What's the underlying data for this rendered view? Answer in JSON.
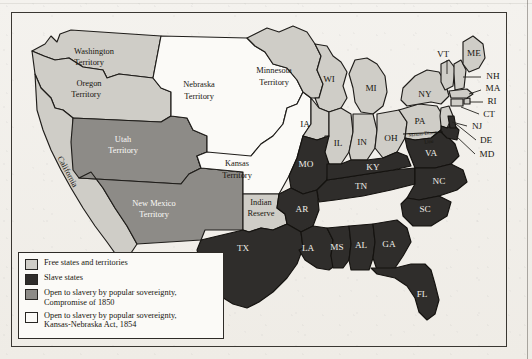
{
  "map": {
    "title_visible": false,
    "frame": true,
    "colors": {
      "free": "#cfcdc7",
      "slave": "#2f2d2b",
      "popular_sovereignty_1850": "#8d8b87",
      "popular_sovereignty_1854": "#fbfaf7",
      "ocean": "#f4f2ee",
      "outline": "#1f1d1a",
      "paper": "#f2f0eb"
    },
    "regions": [
      {
        "id": "washington-territory",
        "label": "Washington\nTerritory",
        "category": "free"
      },
      {
        "id": "oregon-territory",
        "label": "Oregon\nTerritory",
        "category": "free"
      },
      {
        "id": "utah-territory",
        "label": "Utah\nTerritory",
        "category": "popular_sovereignty_1850"
      },
      {
        "id": "california",
        "label": "California",
        "category": "free"
      },
      {
        "id": "new-mexico-territory",
        "label": "New Mexico\nTerritory",
        "category": "popular_sovereignty_1850"
      },
      {
        "id": "nebraska-territory",
        "label": "Nebraska\nTerritory",
        "category": "popular_sovereignty_1854"
      },
      {
        "id": "kansas-territory",
        "label": "Kansas\nTerritory",
        "category": "popular_sovereignty_1854"
      },
      {
        "id": "indian-reserve",
        "label": "Indian\nReserve",
        "category": "free"
      },
      {
        "id": "minnesota-territory",
        "label": "Minnesota\nTerritory",
        "category": "free"
      },
      {
        "id": "wisconsin",
        "label": "WI",
        "category": "free"
      },
      {
        "id": "iowa",
        "label": "IA",
        "category": "free"
      },
      {
        "id": "michigan",
        "label": "MI",
        "category": "free"
      },
      {
        "id": "illinois",
        "label": "IL",
        "category": "free"
      },
      {
        "id": "indiana",
        "label": "IN",
        "category": "free"
      },
      {
        "id": "ohio",
        "label": "OH",
        "category": "free"
      },
      {
        "id": "pennsylvania",
        "label": "PA",
        "category": "free"
      },
      {
        "id": "new-york",
        "label": "NY",
        "category": "free"
      },
      {
        "id": "vermont",
        "label": "VT",
        "category": "free"
      },
      {
        "id": "maine",
        "label": "ME",
        "category": "free"
      },
      {
        "id": "new-hampshire",
        "label": "NH",
        "category": "free"
      },
      {
        "id": "massachusetts",
        "label": "MA",
        "category": "free"
      },
      {
        "id": "rhode-island",
        "label": "RI",
        "category": "free"
      },
      {
        "id": "connecticut",
        "label": "CT",
        "category": "free"
      },
      {
        "id": "new-jersey",
        "label": "NJ",
        "category": "free"
      },
      {
        "id": "delaware",
        "label": "DE",
        "category": "slave"
      },
      {
        "id": "maryland",
        "label": "MD",
        "category": "slave"
      },
      {
        "id": "virginia",
        "label": "VA",
        "category": "slave"
      },
      {
        "id": "north-carolina",
        "label": "NC",
        "category": "slave"
      },
      {
        "id": "south-carolina",
        "label": "SC",
        "category": "slave"
      },
      {
        "id": "georgia",
        "label": "GA",
        "category": "slave"
      },
      {
        "id": "florida",
        "label": "FL",
        "category": "slave"
      },
      {
        "id": "alabama",
        "label": "AL",
        "category": "slave"
      },
      {
        "id": "mississippi",
        "label": "MS",
        "category": "slave"
      },
      {
        "id": "tennessee",
        "label": "TN",
        "category": "slave"
      },
      {
        "id": "kentucky",
        "label": "KY",
        "category": "slave"
      },
      {
        "id": "missouri",
        "label": "MO",
        "category": "slave"
      },
      {
        "id": "arkansas",
        "label": "AR",
        "category": "slave"
      },
      {
        "id": "louisiana",
        "label": "LA",
        "category": "slave"
      },
      {
        "id": "texas",
        "label": "TX",
        "category": "slave"
      }
    ],
    "labels": {
      "washington_territory_l1": "Washington",
      "washington_territory_l2": "Territory",
      "oregon_territory_l1": "Oregon",
      "oregon_territory_l2": "Territory",
      "utah_territory_l1": "Utah",
      "utah_territory_l2": "Territory",
      "california": "California",
      "new_mexico_territory_l1": "New Mexico",
      "new_mexico_territory_l2": "Territory",
      "nebraska_territory_l1": "Nebraska",
      "nebraska_territory_l2": "Territory",
      "kansas_territory_l1": "Kansas",
      "kansas_territory_l2": "Territory",
      "indian_reserve_l1": "Indian",
      "indian_reserve_l2": "Reserve",
      "minnesota_territory_l1": "Minnesota",
      "minnesota_territory_l2": "Territory",
      "mason_dixon_l1": "Mason-Dixon",
      "mason_dixon_l2": "Line",
      "wi": "WI",
      "ia": "IA",
      "mi": "MI",
      "il": "IL",
      "in": "IN",
      "oh": "OH",
      "pa": "PA",
      "ny": "NY",
      "vt": "VT",
      "me": "ME",
      "nh": "NH",
      "ma": "MA",
      "ri": "RI",
      "ct": "CT",
      "nj": "NJ",
      "de": "DE",
      "md": "MD",
      "va": "VA",
      "nc": "NC",
      "sc": "SC",
      "ga": "GA",
      "fl": "FL",
      "al": "AL",
      "ms": "MS",
      "tn": "TN",
      "ky": "KY",
      "mo": "MO",
      "ar": "AR",
      "la": "LA",
      "tx": "TX"
    },
    "legend": {
      "items": [
        {
          "swatch": "#cfcdc7",
          "text": "Free states and territories"
        },
        {
          "swatch": "#2f2d2b",
          "text": "Slave states"
        },
        {
          "swatch": "#8d8b87",
          "text": "Open to slavery by popular sovereignty,\nCompromise of 1850"
        },
        {
          "swatch": "#fbfaf7",
          "text": "Open to slavery by popular sovereignty,\nKansas-Nebraska Act, 1854"
        }
      ]
    }
  }
}
